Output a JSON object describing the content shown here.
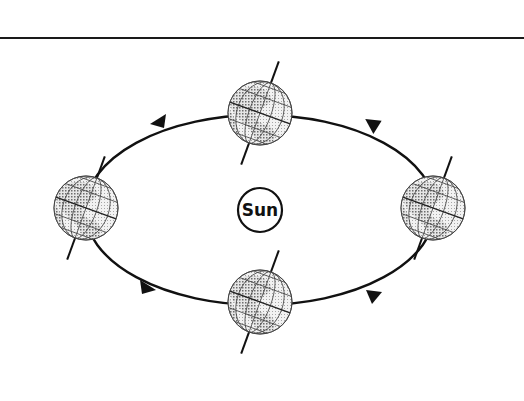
{
  "diagram": {
    "type": "earth-orbit-seasons",
    "divider": {
      "y": 38,
      "color": "#1a1a1a"
    },
    "sun": {
      "label": "Sun",
      "cx": 260,
      "cy": 210,
      "r": 22
    },
    "orbit": {
      "cx": 260,
      "cy": 210,
      "rx": 175,
      "ry": 95,
      "direction": "counterclockwise",
      "color": "#111111"
    },
    "globes": [
      {
        "name": "top",
        "cx": 260,
        "cy": 113,
        "r": 32
      },
      {
        "name": "left",
        "cx": 86,
        "cy": 208,
        "r": 33
      },
      {
        "name": "right",
        "cx": 433,
        "cy": 208,
        "r": 32
      },
      {
        "name": "bottom",
        "cx": 260,
        "cy": 302,
        "r": 33
      }
    ],
    "axis_tilt_deg": 20,
    "arrows": [
      {
        "position": "upper-left",
        "x": 158,
        "y": 122,
        "points": "left"
      },
      {
        "position": "upper-right",
        "x": 372,
        "y": 122,
        "points": "left"
      },
      {
        "position": "lower-left",
        "x": 146,
        "y": 288,
        "points": "right"
      },
      {
        "position": "lower-right",
        "x": 374,
        "y": 296,
        "points": "right"
      }
    ],
    "colors": {
      "stroke": "#111111",
      "globe_dark": "#7a7a7a",
      "globe_light": "#d9d9d9",
      "background": "#ffffff"
    }
  }
}
